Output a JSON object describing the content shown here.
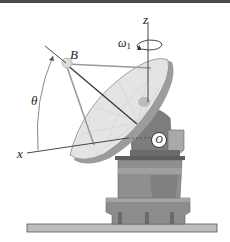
{
  "figure": {
    "labels": {
      "z_axis": "z",
      "x_axis": "x",
      "omega": "ω",
      "omega_sub": "1",
      "point_B": "B",
      "angle": "θ",
      "origin": "O"
    },
    "colors": {
      "dish_light": "#e6e6e6",
      "dish_mid": "#c8c8c8",
      "pedestal": "#8a8a8a",
      "pedestal_dark": "#6e6e6e",
      "ground": "#b8b8b8",
      "line": "#333333",
      "top_bar": "#4a4a4a"
    }
  }
}
